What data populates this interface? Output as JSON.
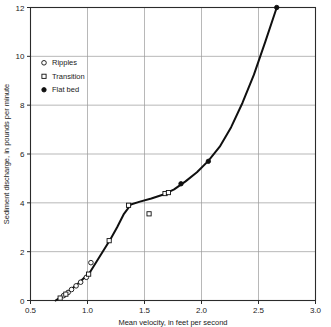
{
  "chart_data": {
    "type": "scatter",
    "title": "",
    "xlabel": "Mean velocity, in feet per second",
    "ylabel": "Sediment discharge, in pounds per minute",
    "xlim": [
      0.5,
      3.0
    ],
    "ylim": [
      0,
      12
    ],
    "xticks": [
      "0.5",
      "1.0",
      "1.5",
      "2.0",
      "2.5",
      "3.0"
    ],
    "xtick_values": [
      0.5,
      1.0,
      1.5,
      2.0,
      2.5,
      3.0
    ],
    "yticks": [
      "0",
      "2",
      "4",
      "6",
      "8",
      "10",
      "12"
    ],
    "ytick_values": [
      0,
      2,
      4,
      6,
      8,
      10,
      12
    ],
    "grid": true,
    "legend_position": "upper-left-inside",
    "legend": [
      {
        "label": "Ripples",
        "marker": "open-circle"
      },
      {
        "label": "Transition",
        "marker": "open-square"
      },
      {
        "label": "Flat bed",
        "marker": "filled-circle"
      }
    ],
    "series": [
      {
        "name": "Ripples",
        "marker": "open-circle",
        "points": [
          {
            "x": 0.79,
            "y": 0.2
          },
          {
            "x": 0.83,
            "y": 0.33
          },
          {
            "x": 0.86,
            "y": 0.45
          },
          {
            "x": 0.9,
            "y": 0.6
          },
          {
            "x": 0.94,
            "y": 0.75
          },
          {
            "x": 0.99,
            "y": 0.95
          },
          {
            "x": 1.03,
            "y": 1.55
          }
        ]
      },
      {
        "name": "Transition",
        "marker": "open-square",
        "points": [
          {
            "x": 0.76,
            "y": 0.1
          },
          {
            "x": 0.81,
            "y": 0.26
          },
          {
            "x": 1.01,
            "y": 1.08
          },
          {
            "x": 1.19,
            "y": 2.45
          },
          {
            "x": 1.36,
            "y": 3.9
          },
          {
            "x": 1.54,
            "y": 3.55
          },
          {
            "x": 1.68,
            "y": 4.38
          },
          {
            "x": 1.71,
            "y": 4.42
          }
        ]
      },
      {
        "name": "Flat bed",
        "marker": "filled-circle",
        "points": [
          {
            "x": 1.82,
            "y": 4.78
          },
          {
            "x": 2.06,
            "y": 5.7
          },
          {
            "x": 2.66,
            "y": 12.0
          }
        ]
      }
    ],
    "fitted_curve": [
      {
        "x": 0.72,
        "y": 0.0
      },
      {
        "x": 0.78,
        "y": 0.18
      },
      {
        "x": 0.84,
        "y": 0.4
      },
      {
        "x": 0.9,
        "y": 0.62
      },
      {
        "x": 0.96,
        "y": 0.88
      },
      {
        "x": 1.02,
        "y": 1.15
      },
      {
        "x": 1.08,
        "y": 1.6
      },
      {
        "x": 1.14,
        "y": 2.05
      },
      {
        "x": 1.2,
        "y": 2.5
      },
      {
        "x": 1.26,
        "y": 3.0
      },
      {
        "x": 1.32,
        "y": 3.55
      },
      {
        "x": 1.38,
        "y": 3.93
      },
      {
        "x": 1.46,
        "y": 4.05
      },
      {
        "x": 1.56,
        "y": 4.18
      },
      {
        "x": 1.66,
        "y": 4.33
      },
      {
        "x": 1.76,
        "y": 4.55
      },
      {
        "x": 1.86,
        "y": 4.88
      },
      {
        "x": 1.96,
        "y": 5.25
      },
      {
        "x": 2.06,
        "y": 5.72
      },
      {
        "x": 2.16,
        "y": 6.3
      },
      {
        "x": 2.26,
        "y": 7.1
      },
      {
        "x": 2.36,
        "y": 8.1
      },
      {
        "x": 2.46,
        "y": 9.25
      },
      {
        "x": 2.56,
        "y": 10.6
      },
      {
        "x": 2.66,
        "y": 12.0
      }
    ]
  }
}
